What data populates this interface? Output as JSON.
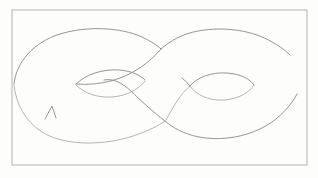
{
  "image": {
    "kind": "hand-drawn-sketch",
    "subject": "double torus (genus-2 surface) / figure-eight band",
    "medium": "graphite pencil on white paper",
    "width": 318,
    "height": 178,
    "text_content": "",
    "has_visible_text": false
  },
  "colors": {
    "paper": "#fdfdfc",
    "page_background": "#ffffff",
    "frame_stroke": "#b9b9b9",
    "pencil_stroke": "#8f8f8f",
    "pencil_stroke_light": "#a8a8a8",
    "pencil_stroke_dark": "#7c7c7c",
    "pencil_stroke_faint": "#bdbdbd"
  },
  "frame": {
    "name": "drawing-border-rectangle",
    "x": 12,
    "y": 10,
    "width": 295,
    "height": 155
  },
  "drawing": {
    "description": "Two overlapping lobes forming a lemniscate / infinity band, each lobe containing a lens-shaped inner hole, crossing near the middle.",
    "strokes": [
      {
        "name": "outer-top-left-arc",
        "style": "pencil",
        "d": "M 14 84 C 16 62 34 42 60 34 C 86 26 120 27 142 37 C 152 42 157 45 161 49"
      },
      {
        "name": "outer-top-right-arc",
        "style": "pencil",
        "d": "M 161 49 C 170 41 182 34 198 31 C 226 26 254 31 272 42 C 281 47 286 51 290 55"
      },
      {
        "name": "outer-bottom-left-arc",
        "style": "pencil-light",
        "d": "M 14 85 C 16 104 25 121 42 132 C 66 147 106 145 133 136 C 148 131 158 126 165 121"
      },
      {
        "name": "outer-bottom-right-arc",
        "style": "pencil",
        "d": "M 165 121 C 173 128 184 134 199 137 C 226 142 256 135 276 119 C 288 109 294 100 297 94"
      },
      {
        "name": "inner-left-band-upper",
        "style": "pencil",
        "d": "M 161 49 C 150 62 136 72 120 78 C 104 84 88 85 76 84"
      },
      {
        "name": "inner-left-band-lower",
        "style": "pencil",
        "d": "M 165 121 C 152 111 140 100 131 91 C 122 83 113 78 104 80"
      },
      {
        "name": "left-lens-hole-upper",
        "style": "pencil",
        "d": "M 76 84 C 86 74 103 69 119 70 C 132 71 140 75 145 80"
      },
      {
        "name": "left-lens-hole-lower",
        "style": "pencil-light",
        "d": "M 76 85 C 84 93 97 98 112 97 C 127 96 139 89 145 81"
      },
      {
        "name": "right-lens-hole-upper",
        "style": "pencil",
        "d": "M 190 86 C 197 77 212 72 227 73 C 241 74 250 79 254 85"
      },
      {
        "name": "right-lens-hole-lower",
        "style": "pencil-light",
        "d": "M 190 86 C 196 95 209 101 224 100 C 239 99 250 92 254 85"
      },
      {
        "name": "right-band-upper-connector",
        "style": "pencil",
        "d": "M 182 78 C 186 81 188 84 190 86"
      },
      {
        "name": "right-band-lower-connector",
        "style": "pencil-light",
        "d": "M 166 120 C 174 106 180 94 190 86"
      },
      {
        "name": "left-cusp-notch",
        "style": "pencil",
        "d": "M 45 119 L 52 106 L 56 118"
      }
    ]
  },
  "annotations": {
    "open_gap_right": "The outer right boundary is left open between the upper arc end (~290,55) and lower arc end (~297,94).",
    "crossing_upper": {
      "x": 161,
      "y": 49
    },
    "crossing_lower": {
      "x": 165,
      "y": 121
    },
    "left_tip": {
      "x": 14,
      "y": 84
    }
  }
}
